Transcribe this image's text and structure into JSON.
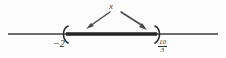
{
  "figure": {
    "type": "number-line-interval",
    "variable_label": "x",
    "axis": {
      "line_color": "#3c3c3c",
      "start_x": 8,
      "end_x": 218,
      "y": 34
    },
    "interval": {
      "left_bracket": "(",
      "right_bracket": ")",
      "left_endpoint_label": "−2",
      "right_endpoint_numerator": "10",
      "right_endpoint_denominator": "3",
      "left_included": false,
      "right_included": false,
      "segment_color": "#242424",
      "segment_start_x": 66,
      "segment_end_x": 157
    },
    "arrows": {
      "count": 2,
      "color": "#4a4a4a",
      "left_arrow": {
        "from_x": 110,
        "from_y": 12,
        "to_x": 88,
        "to_y": 28
      },
      "right_arrow": {
        "from_x": 121,
        "from_y": 12,
        "to_x": 145,
        "to_y": 29
      }
    },
    "background_color": "#fdfdfd"
  }
}
